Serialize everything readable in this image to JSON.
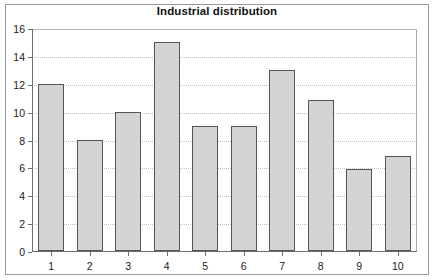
{
  "chart_data": {
    "type": "bar",
    "title": "Industrial distribution",
    "xlabel": "",
    "ylabel": "",
    "categories": [
      "1",
      "2",
      "3",
      "4",
      "5",
      "6",
      "7",
      "8",
      "9",
      "10"
    ],
    "values": [
      12,
      8,
      10,
      15,
      9,
      9,
      13,
      10.8,
      5.9,
      6.8
    ],
    "ylim": [
      0,
      16
    ],
    "yticks": [
      0,
      2,
      4,
      6,
      8,
      10,
      12,
      14,
      16
    ],
    "ytick_labels": [
      "0",
      "2",
      "4",
      "6",
      "8",
      "10",
      "12",
      "14",
      "16"
    ],
    "grid": true,
    "grid_axis": "y",
    "legend": false,
    "series": [
      {
        "name": "Industrial distribution",
        "values": [
          12,
          8,
          10,
          15,
          9,
          9,
          13,
          10.8,
          5.9,
          6.8
        ]
      }
    ],
    "colors": {
      "bar_fill": "#d4d4d4",
      "bar_border": "#555555",
      "gridline": "#c2c2c2",
      "axis": "#6e6e6e",
      "text": "#1a1a1a",
      "frame": "#9a9a9a",
      "background": "#ffffff"
    }
  }
}
